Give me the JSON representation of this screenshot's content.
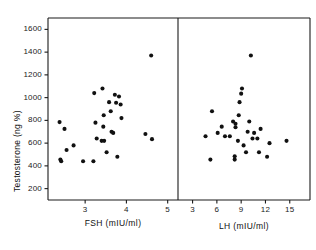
{
  "chart_data": {
    "type": "scatter",
    "title": "",
    "ylabel": "Testosterone (ng %)",
    "ylim": [
      100,
      1700
    ],
    "yticks": [
      200,
      400,
      600,
      800,
      1000,
      1200,
      1400,
      1600
    ],
    "grid": false,
    "legend": null,
    "panels": [
      {
        "name": "fsh-panel",
        "xlabel": "FSH (mIU/ml)",
        "xticks": [
          3,
          4,
          5
        ],
        "xlim": [
          2.1,
          5.25
        ],
        "points": [
          {
            "x": 2.38,
            "y": 785
          },
          {
            "x": 2.5,
            "y": 725
          },
          {
            "x": 2.4,
            "y": 455
          },
          {
            "x": 2.42,
            "y": 440
          },
          {
            "x": 2.55,
            "y": 540
          },
          {
            "x": 2.72,
            "y": 580
          },
          {
            "x": 2.95,
            "y": 440
          },
          {
            "x": 3.22,
            "y": 1040
          },
          {
            "x": 3.25,
            "y": 780
          },
          {
            "x": 3.28,
            "y": 640
          },
          {
            "x": 3.2,
            "y": 440
          },
          {
            "x": 3.42,
            "y": 1080
          },
          {
            "x": 3.45,
            "y": 845
          },
          {
            "x": 3.44,
            "y": 745
          },
          {
            "x": 3.4,
            "y": 620
          },
          {
            "x": 3.46,
            "y": 620
          },
          {
            "x": 3.52,
            "y": 520
          },
          {
            "x": 3.58,
            "y": 960
          },
          {
            "x": 3.62,
            "y": 880
          },
          {
            "x": 3.64,
            "y": 700
          },
          {
            "x": 3.68,
            "y": 690
          },
          {
            "x": 3.72,
            "y": 1025
          },
          {
            "x": 3.75,
            "y": 955
          },
          {
            "x": 3.78,
            "y": 480
          },
          {
            "x": 3.82,
            "y": 1010
          },
          {
            "x": 3.86,
            "y": 940
          },
          {
            "x": 3.88,
            "y": 820
          },
          {
            "x": 4.46,
            "y": 680
          },
          {
            "x": 4.62,
            "y": 635
          },
          {
            "x": 4.6,
            "y": 1370
          }
        ]
      },
      {
        "name": "lh-panel",
        "xlabel": "LH (mIU/ml)",
        "xticks": [
          3,
          6,
          9,
          12,
          15
        ],
        "xlim": [
          1.2,
          17.5
        ],
        "points": [
          {
            "x": 4.6,
            "y": 660
          },
          {
            "x": 5.2,
            "y": 455
          },
          {
            "x": 5.4,
            "y": 880
          },
          {
            "x": 6.1,
            "y": 690
          },
          {
            "x": 6.6,
            "y": 745
          },
          {
            "x": 7.0,
            "y": 660
          },
          {
            "x": 7.6,
            "y": 660
          },
          {
            "x": 8.0,
            "y": 790
          },
          {
            "x": 8.3,
            "y": 770
          },
          {
            "x": 8.3,
            "y": 740
          },
          {
            "x": 8.2,
            "y": 455
          },
          {
            "x": 8.2,
            "y": 485
          },
          {
            "x": 8.6,
            "y": 620
          },
          {
            "x": 8.7,
            "y": 845
          },
          {
            "x": 8.8,
            "y": 960
          },
          {
            "x": 9.0,
            "y": 1035
          },
          {
            "x": 9.1,
            "y": 1080
          },
          {
            "x": 9.3,
            "y": 580
          },
          {
            "x": 9.6,
            "y": 520
          },
          {
            "x": 9.8,
            "y": 700
          },
          {
            "x": 10.0,
            "y": 790
          },
          {
            "x": 10.2,
            "y": 1370
          },
          {
            "x": 10.4,
            "y": 640
          },
          {
            "x": 10.6,
            "y": 690
          },
          {
            "x": 11.0,
            "y": 640
          },
          {
            "x": 11.2,
            "y": 520
          },
          {
            "x": 11.4,
            "y": 725
          },
          {
            "x": 12.2,
            "y": 480
          },
          {
            "x": 12.5,
            "y": 600
          },
          {
            "x": 14.6,
            "y": 620
          }
        ]
      }
    ]
  },
  "style": {
    "axis_color": "#1a1a1a",
    "point_color": "#111111",
    "background": "#ffffff"
  }
}
